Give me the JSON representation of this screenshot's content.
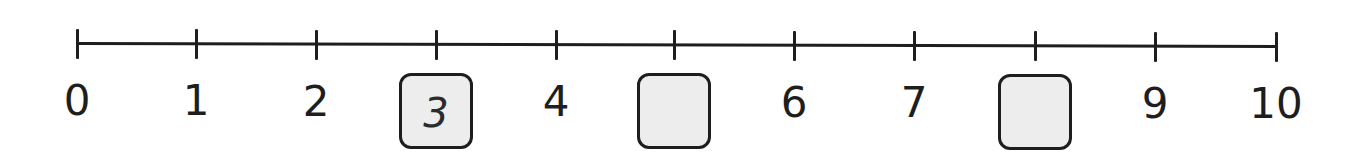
{
  "number_line": {
    "min": 0,
    "max": 10,
    "tick_values": [
      0,
      1,
      2,
      3,
      4,
      5,
      6,
      7,
      8,
      9,
      10
    ],
    "tick_x": [
      77,
      196,
      316,
      436,
      556,
      674,
      794,
      914,
      1035,
      1155,
      1276
    ],
    "line_color": "#1e1e1e",
    "labels": [
      {
        "value": 0,
        "text": "0",
        "x": 77
      },
      {
        "value": 1,
        "text": "1",
        "x": 196
      },
      {
        "value": 2,
        "text": "2",
        "x": 316
      },
      {
        "value": 4,
        "text": "4",
        "x": 556
      },
      {
        "value": 6,
        "text": "6",
        "x": 794
      },
      {
        "value": 7,
        "text": "7",
        "x": 914
      },
      {
        "value": 9,
        "text": "9",
        "x": 1155
      },
      {
        "value": 10,
        "text": "10",
        "x": 1276
      }
    ],
    "answer_boxes": [
      {
        "position": 3,
        "value": "3",
        "filled": true,
        "x": 436
      },
      {
        "position": 5,
        "value": "",
        "filled": false,
        "x": 674
      },
      {
        "position": 8,
        "value": "",
        "filled": false,
        "x": 1035
      }
    ],
    "box_fill_color": "#ededed",
    "box_border_color": "#1e1e1e"
  }
}
